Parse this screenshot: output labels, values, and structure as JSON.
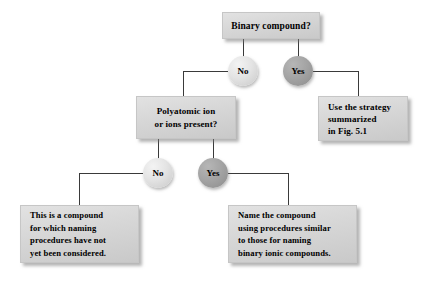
{
  "diagram": {
    "colors": {
      "box_fill_top": "#e2e2e2",
      "box_fill_bottom": "#c9c9c9",
      "circle_light": "#e4e4e4",
      "circle_dark": "#a3a3a3",
      "line": "#3a3a3a",
      "text": "#000000",
      "background": "#ffffff"
    },
    "nodes": [
      {
        "id": "binary-compound-question",
        "type": "box",
        "align": "center",
        "lines": [
          "Binary compound?"
        ]
      },
      {
        "id": "decision-no-top",
        "type": "circle",
        "shade": "light",
        "label": "No"
      },
      {
        "id": "decision-yes-top",
        "type": "circle",
        "shade": "dark",
        "label": "Yes"
      },
      {
        "id": "use-strategy-fig",
        "type": "box",
        "align": "left",
        "lines": [
          "Use the strategy",
          "summarized",
          "in Fig. 5.1"
        ]
      },
      {
        "id": "polyatomic-ion-question",
        "type": "box",
        "align": "center",
        "lines": [
          "Polyatomic ion",
          "or ions present?"
        ]
      },
      {
        "id": "decision-no-bottom",
        "type": "circle",
        "shade": "light",
        "label": "No"
      },
      {
        "id": "decision-yes-bottom",
        "type": "circle",
        "shade": "dark",
        "label": "Yes"
      },
      {
        "id": "not-considered-result",
        "type": "box",
        "align": "left",
        "lines": [
          "This is a compound",
          "for which naming",
          "procedures have not",
          "yet been considered."
        ]
      },
      {
        "id": "name-like-binary-ionic-result",
        "type": "box",
        "align": "left",
        "lines": [
          "Name the compound",
          "using procedures similar",
          "to those for naming",
          "binary ionic compounds."
        ]
      }
    ]
  }
}
